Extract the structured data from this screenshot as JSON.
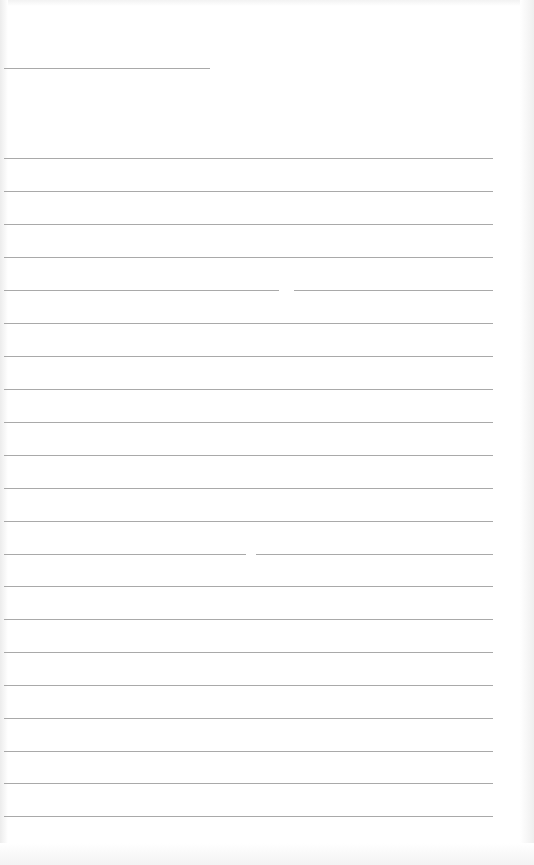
{
  "page": {
    "type": "blank lined form",
    "background": "#ffffff",
    "line_color": "#9a9a9a"
  },
  "header_line": {
    "y": 68,
    "x1": 4,
    "x2": 210
  },
  "lines": [
    {
      "y": 158,
      "x1": 4,
      "x2": 493
    },
    {
      "y": 191,
      "x1": 4,
      "x2": 493
    },
    {
      "y": 224,
      "x1": 4,
      "x2": 493
    },
    {
      "y": 257,
      "x1": 4,
      "x2": 493
    },
    {
      "y": 290,
      "x1": 4,
      "x2": 493,
      "gap": [
        279,
        294
      ]
    },
    {
      "y": 323,
      "x1": 4,
      "x2": 493
    },
    {
      "y": 356,
      "x1": 4,
      "x2": 493
    },
    {
      "y": 389,
      "x1": 4,
      "x2": 493
    },
    {
      "y": 422,
      "x1": 4,
      "x2": 493
    },
    {
      "y": 455,
      "x1": 4,
      "x2": 493
    },
    {
      "y": 488,
      "x1": 4,
      "x2": 493
    },
    {
      "y": 521,
      "x1": 4,
      "x2": 493
    },
    {
      "y": 554,
      "x1": 4,
      "x2": 493,
      "gap": [
        246,
        256
      ]
    },
    {
      "y": 586,
      "x1": 4,
      "x2": 493
    },
    {
      "y": 619,
      "x1": 4,
      "x2": 493
    },
    {
      "y": 652,
      "x1": 4,
      "x2": 493
    },
    {
      "y": 685,
      "x1": 4,
      "x2": 493
    },
    {
      "y": 718,
      "x1": 4,
      "x2": 493
    },
    {
      "y": 751,
      "x1": 4,
      "x2": 493
    },
    {
      "y": 783,
      "x1": 4,
      "x2": 493
    },
    {
      "y": 816,
      "x1": 4,
      "x2": 493
    }
  ]
}
